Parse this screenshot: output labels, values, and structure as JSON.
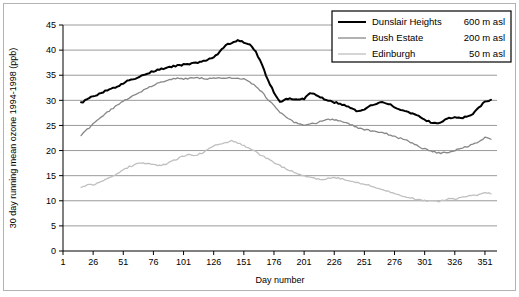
{
  "chart_data": {
    "type": "line",
    "title": "",
    "xlabel": "Day number",
    "ylabel": "30 day running mean ozone 1994-1998 (ppb)",
    "xlim": [
      1,
      361
    ],
    "ylim": [
      0,
      45
    ],
    "xticks": [
      1,
      26,
      51,
      76,
      101,
      126,
      151,
      176,
      201,
      226,
      251,
      276,
      301,
      326,
      351
    ],
    "yticks": [
      0,
      5,
      10,
      15,
      20,
      25,
      30,
      35,
      40,
      45
    ],
    "grid": "horizontal",
    "legend_position": "top-right",
    "series": [
      {
        "name": "Dunslair Heights",
        "altitude_label": "600 m asl",
        "color": "#000000",
        "width": 2.0,
        "x": [
          16,
          21,
          26,
          31,
          36,
          41,
          46,
          51,
          56,
          61,
          66,
          71,
          76,
          81,
          86,
          91,
          96,
          101,
          106,
          111,
          116,
          121,
          126,
          131,
          136,
          141,
          146,
          151,
          156,
          161,
          166,
          171,
          176,
          181,
          186,
          191,
          196,
          201,
          206,
          211,
          216,
          221,
          226,
          231,
          236,
          241,
          246,
          251,
          256,
          261,
          266,
          271,
          276,
          281,
          286,
          291,
          296,
          301,
          306,
          311,
          316,
          321,
          326,
          331,
          336,
          341,
          346,
          351,
          356
        ],
        "y": [
          29.5,
          30.2,
          30.8,
          31.3,
          31.8,
          32.2,
          32.8,
          33.4,
          34.0,
          34.4,
          34.9,
          35.3,
          35.8,
          36.1,
          36.4,
          36.7,
          36.9,
          37.1,
          37.2,
          37.5,
          37.7,
          38.0,
          38.6,
          39.6,
          41.1,
          41.3,
          41.9,
          41.6,
          41.0,
          39.7,
          37.1,
          34.0,
          31.6,
          29.7,
          30.2,
          30.3,
          30.2,
          30.3,
          31.5,
          31.1,
          30.4,
          29.9,
          29.6,
          29.3,
          28.9,
          28.3,
          27.8,
          28.2,
          28.9,
          29.4,
          29.8,
          29.3,
          28.6,
          28.2,
          27.8,
          27.4,
          26.8,
          26.2,
          25.6,
          25.4,
          25.9,
          26.4,
          26.6,
          26.5,
          26.8,
          27.2,
          28.6,
          29.8,
          30.0
        ]
      },
      {
        "name": "Bush Estate",
        "altitude_label": "200 m asl",
        "color": "#878787",
        "width": 1.3,
        "x": [
          16,
          21,
          26,
          31,
          36,
          41,
          46,
          51,
          56,
          61,
          66,
          71,
          76,
          81,
          86,
          91,
          96,
          101,
          106,
          111,
          116,
          121,
          126,
          131,
          136,
          141,
          146,
          151,
          156,
          161,
          166,
          171,
          176,
          181,
          186,
          191,
          196,
          201,
          206,
          211,
          216,
          221,
          226,
          231,
          236,
          241,
          246,
          251,
          256,
          261,
          266,
          271,
          276,
          281,
          286,
          291,
          296,
          301,
          306,
          311,
          316,
          321,
          326,
          331,
          336,
          341,
          346,
          351,
          356
        ],
        "y": [
          23.0,
          24.2,
          25.3,
          26.3,
          27.3,
          28.2,
          29.0,
          29.8,
          30.5,
          31.2,
          31.8,
          32.4,
          33.0,
          33.5,
          33.8,
          34.2,
          34.5,
          34.3,
          34.4,
          34.5,
          34.4,
          34.3,
          34.4,
          34.5,
          34.5,
          34.5,
          34.4,
          34.2,
          33.7,
          32.8,
          31.6,
          30.2,
          28.9,
          27.6,
          26.6,
          25.9,
          25.3,
          25.0,
          25.2,
          25.5,
          25.9,
          26.2,
          26.1,
          25.9,
          25.5,
          25.0,
          24.5,
          24.2,
          24.0,
          23.8,
          23.6,
          23.2,
          22.8,
          22.4,
          22.0,
          21.4,
          20.8,
          20.3,
          19.9,
          19.6,
          19.5,
          19.6,
          20.0,
          20.4,
          20.8,
          21.2,
          21.6,
          22.6,
          22.3
        ]
      },
      {
        "name": "Edinburgh",
        "altitude_label": "50 m asl",
        "color": "#bfbfbf",
        "width": 1.3,
        "x": [
          16,
          21,
          26,
          31,
          36,
          41,
          46,
          51,
          56,
          61,
          66,
          71,
          76,
          81,
          86,
          91,
          96,
          101,
          106,
          111,
          116,
          121,
          126,
          131,
          136,
          141,
          146,
          151,
          156,
          161,
          166,
          171,
          176,
          181,
          186,
          191,
          196,
          201,
          206,
          211,
          216,
          221,
          226,
          231,
          236,
          241,
          246,
          251,
          256,
          261,
          266,
          271,
          276,
          281,
          286,
          291,
          296,
          301,
          306,
          311,
          316,
          321,
          326,
          331,
          336,
          341,
          346,
          351,
          356
        ],
        "y": [
          12.5,
          13.2,
          13.1,
          13.6,
          14.2,
          14.8,
          15.5,
          16.2,
          16.8,
          17.2,
          17.5,
          17.4,
          17.2,
          17.0,
          17.2,
          17.8,
          18.4,
          18.9,
          19.2,
          19.1,
          19.5,
          20.2,
          20.9,
          21.4,
          21.6,
          22.0,
          21.5,
          21.0,
          20.4,
          19.7,
          19.0,
          18.3,
          17.6,
          17.0,
          16.4,
          15.9,
          15.3,
          14.9,
          14.6,
          14.4,
          14.3,
          14.5,
          14.6,
          14.4,
          14.2,
          13.9,
          13.6,
          13.3,
          13.0,
          12.6,
          12.2,
          11.8,
          11.4,
          11.1,
          10.8,
          10.5,
          10.2,
          10.0,
          9.9,
          9.9,
          10.0,
          10.5,
          10.3,
          10.6,
          10.9,
          11.0,
          11.2,
          11.6,
          11.4
        ]
      }
    ]
  },
  "legend": {
    "rows": [
      {
        "name": "Dunslair Heights",
        "altitude": "600 m asl"
      },
      {
        "name": "Bush Estate",
        "altitude": "200 m asl"
      },
      {
        "name": "Edinburgh",
        "altitude": "50 m asl"
      }
    ]
  },
  "axes": {
    "x_title": "Day number",
    "y_title": "30 day running mean ozone 1994-1998 (ppb)"
  }
}
